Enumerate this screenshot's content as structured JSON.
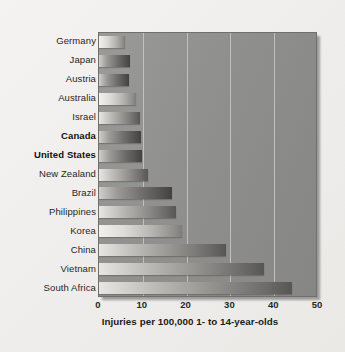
{
  "chart_data": {
    "type": "bar",
    "orientation": "horizontal",
    "title": "",
    "subtitle": "",
    "xlabel": "Injuries per 100,000 1- to 14-year-olds",
    "ylabel": "",
    "xlim": [
      0,
      50
    ],
    "xticks": [
      0,
      10,
      20,
      30,
      40,
      50
    ],
    "xtick_labels": [
      "0",
      "10",
      "20",
      "30",
      "40",
      "50"
    ],
    "grid": true,
    "gridlines_axis": "x",
    "legend": "none",
    "categories": [
      "Germany",
      "Japan",
      "Austria",
      "Australia",
      "Israel",
      "Canada",
      "United States",
      "New Zealand",
      "Brazil",
      "Philippines",
      "Korea",
      "China",
      "Vietnam",
      "South Africa"
    ],
    "values": [
      6.0,
      7.0,
      6.8,
      8.4,
      9.3,
      9.5,
      9.9,
      11.2,
      16.6,
      17.5,
      18.9,
      29.0,
      37.6,
      44.0
    ],
    "highlighted_categories": [
      "Canada",
      "United States"
    ],
    "bar_styles": [
      "light",
      "dark",
      "dark",
      "light",
      "normal",
      "dark",
      "dark",
      "normal",
      "dark",
      "normal",
      "light",
      "normal",
      "normal",
      "normal"
    ],
    "colors": {
      "plot_background": "#8f8e8c",
      "figure_background": "#f1f0ee",
      "gridline": "#c9c9c6",
      "bar_light_end": "#e7e6e2",
      "bar_dark_end": "#575654",
      "text": "#27261f"
    }
  },
  "axis": {
    "caption": "Injuries per 100,000 1- to 14-year-olds"
  }
}
